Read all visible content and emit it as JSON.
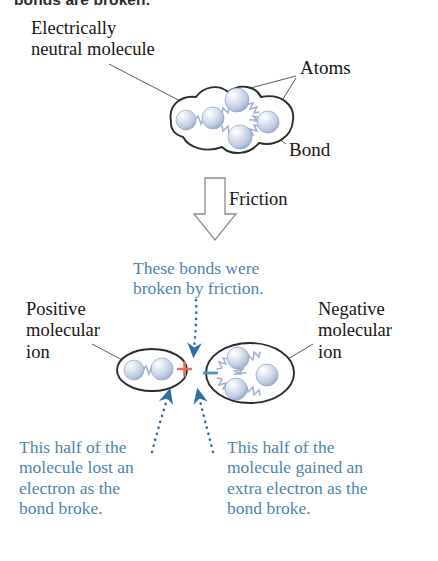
{
  "figure": {
    "header_partial": "bonds are broken.",
    "background": "#ffffff",
    "colors": {
      "atom_fill": "#c3cfe4",
      "atom_edge": "#8fa3c4",
      "outline": "#2b2b2b",
      "blue_text": "#4f83b0",
      "blue_arrow": "#2f6fa8",
      "plus_sign": "#e0715e",
      "minus_sign": "#4b95c4",
      "leader_line": "#5a5a5a",
      "bond_spring": "#9fb0cc",
      "block_arrow_edge": "#8b8b8b"
    }
  },
  "labels": {
    "neutral_molecule": "Electrically\nneutral molecule",
    "atoms": "Atoms",
    "bond": "Bond",
    "friction": "Friction",
    "broken_by_friction": "These bonds were\nbroken by friction.",
    "positive_ion": "Positive\nmolecular\nion",
    "negative_ion": "Negative\nmolecular\nion",
    "caption_left": "This half of the\nmolecule lost an\nelectron as the\nbond broke.",
    "caption_right": "This half of the\nmolecule gained an\nextra electron as the\nbond broke."
  },
  "charge_symbols": {
    "positive": "+",
    "negative": "−"
  },
  "diagram": {
    "top_molecule": {
      "atom_count": 5,
      "atoms": [
        {
          "cx": 186,
          "cy": 120,
          "r": 10
        },
        {
          "cx": 213,
          "cy": 118,
          "r": 11
        },
        {
          "cx": 237,
          "cy": 100,
          "r": 12
        },
        {
          "cx": 240,
          "cy": 136,
          "r": 12
        },
        {
          "cx": 268,
          "cy": 122,
          "r": 11
        }
      ],
      "bonds": 5
    },
    "positive_ion_molecule": {
      "atom_count": 2,
      "atoms": [
        {
          "cx": 134,
          "cy": 370,
          "r": 10
        },
        {
          "cx": 162,
          "cy": 369,
          "r": 11
        }
      ],
      "bonds": 1
    },
    "negative_ion_molecule": {
      "atom_count": 3,
      "atoms": [
        {
          "cx": 238,
          "cy": 358,
          "r": 11
        },
        {
          "cx": 236,
          "cy": 388,
          "r": 11
        },
        {
          "cx": 266,
          "cy": 375,
          "r": 11
        }
      ],
      "bonds": 3
    },
    "block_arrow": {
      "direction": "down",
      "label": "Friction"
    },
    "dotted_arrows": 3
  }
}
